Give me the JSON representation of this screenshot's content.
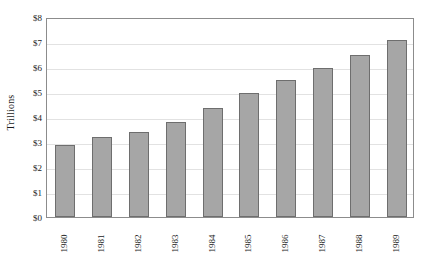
{
  "chart_data": {
    "type": "bar",
    "title": "",
    "subtitle": "",
    "xlabel": "",
    "ylabel": "Trillions",
    "categories": [
      "1980",
      "1981",
      "1982",
      "1983",
      "1984",
      "1985",
      "1986",
      "1987",
      "1988",
      "1989"
    ],
    "values": [
      2.9,
      3.2,
      3.4,
      3.8,
      4.35,
      4.95,
      5.5,
      5.95,
      6.5,
      7.1
    ],
    "ylim": [
      0,
      8
    ],
    "ytick_values": [
      0,
      1,
      2,
      3,
      4,
      5,
      6,
      7,
      8
    ],
    "ytick_labels": [
      "$0",
      "$1",
      "$2",
      "$3",
      "$4",
      "$5",
      "$6",
      "$7",
      "$8"
    ],
    "grid": true,
    "legend": "none",
    "series": [
      {
        "name": "Trillions",
        "values": [
          2.9,
          3.2,
          3.4,
          3.8,
          4.35,
          4.95,
          5.5,
          5.95,
          6.5,
          7.1
        ]
      }
    ],
    "colors": {
      "bar_fill": "#a6a6a6",
      "bar_border": "#6e6e6e",
      "gridline": "#e2e2e2",
      "axis_border": "#8c8c8c",
      "text": "#1a1a1a",
      "background": "#ffffff"
    }
  }
}
